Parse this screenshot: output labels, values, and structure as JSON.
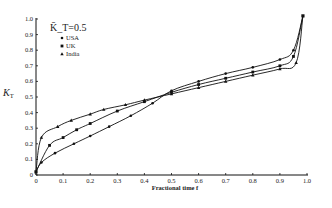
{
  "chart_data": {
    "type": "line",
    "title": "",
    "xlabel": "Fractional time f",
    "ylabel": "K_T",
    "xlim": [
      0,
      1.0
    ],
    "ylim": [
      0,
      1.0
    ],
    "grid": false,
    "legend_position": "upper-left",
    "legend_title": "K̄_T=0.5",
    "xticks": [
      "0",
      "0.1",
      "0.2",
      "0.3",
      "0.4",
      "0.5",
      "0.6",
      "0.7",
      "0.8",
      "0.9",
      "1.0"
    ],
    "yticks": [
      "0",
      "0.1",
      "0.2",
      "0.3",
      "0.4",
      "0.5",
      "0.6",
      "0.7",
      "0.8",
      "0.9",
      "1.0"
    ],
    "series": [
      {
        "name": "USA",
        "marker": "dot",
        "x": [
          0.0,
          0.02,
          0.07,
          0.14,
          0.2,
          0.27,
          0.35,
          0.43,
          0.5,
          0.6,
          0.7,
          0.8,
          0.9,
          0.95,
          0.985
        ],
        "values": [
          0.02,
          0.08,
          0.14,
          0.2,
          0.25,
          0.31,
          0.38,
          0.46,
          0.54,
          0.6,
          0.65,
          0.69,
          0.74,
          0.8,
          1.02
        ]
      },
      {
        "name": "UK",
        "marker": "square",
        "x": [
          0.0,
          0.05,
          0.1,
          0.15,
          0.2,
          0.3,
          0.4,
          0.5,
          0.6,
          0.7,
          0.8,
          0.9,
          0.95,
          0.985
        ],
        "values": [
          0.02,
          0.19,
          0.24,
          0.29,
          0.33,
          0.41,
          0.47,
          0.53,
          0.58,
          0.62,
          0.66,
          0.7,
          0.76,
          1.02
        ]
      },
      {
        "name": "India",
        "marker": "triangle",
        "x": [
          0.0,
          0.02,
          0.08,
          0.13,
          0.2,
          0.25,
          0.33,
          0.4,
          0.5,
          0.6,
          0.7,
          0.8,
          0.9,
          0.96,
          0.985
        ],
        "values": [
          0.02,
          0.24,
          0.31,
          0.35,
          0.39,
          0.42,
          0.45,
          0.48,
          0.52,
          0.56,
          0.6,
          0.64,
          0.68,
          0.72,
          1.02
        ]
      }
    ]
  }
}
